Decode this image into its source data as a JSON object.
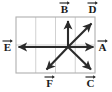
{
  "figure": {
    "background_color": "#ffffff",
    "grid": {
      "border_color": "#b5b5b5",
      "line_color": "#c9c9c9",
      "x": 16,
      "y": 17,
      "width": 79,
      "height": 56,
      "columns": 4,
      "rows": 2
    },
    "origin": {
      "x": 68,
      "y": 47
    },
    "vector_color": "#2b2b2b",
    "vectors": [
      {
        "name": "A",
        "label": "A",
        "direction": "right",
        "tip": {
          "x": 95,
          "y": 47
        },
        "label_pos": {
          "x": 97,
          "y": 41
        }
      },
      {
        "name": "B",
        "label": "B",
        "direction": "up",
        "tip": {
          "x": 68,
          "y": 19
        },
        "label_pos": {
          "x": 61,
          "y": 2
        }
      },
      {
        "name": "C",
        "label": "C",
        "direction": "down-right",
        "tip": {
          "x": 93,
          "y": 71
        },
        "label_pos": {
          "x": 86,
          "y": 77
        }
      },
      {
        "name": "D",
        "label": "D",
        "direction": "up-right",
        "tip": {
          "x": 93,
          "y": 21
        },
        "label_pos": {
          "x": 87,
          "y": 2
        }
      },
      {
        "name": "E",
        "label": "E",
        "direction": "left",
        "tip": {
          "x": 16,
          "y": 47
        },
        "label_pos": {
          "x": 2,
          "y": 41
        }
      },
      {
        "name": "F",
        "label": "F",
        "direction": "down-left",
        "tip": {
          "x": 45,
          "y": 71
        },
        "label_pos": {
          "x": 45,
          "y": 77
        }
      }
    ]
  }
}
